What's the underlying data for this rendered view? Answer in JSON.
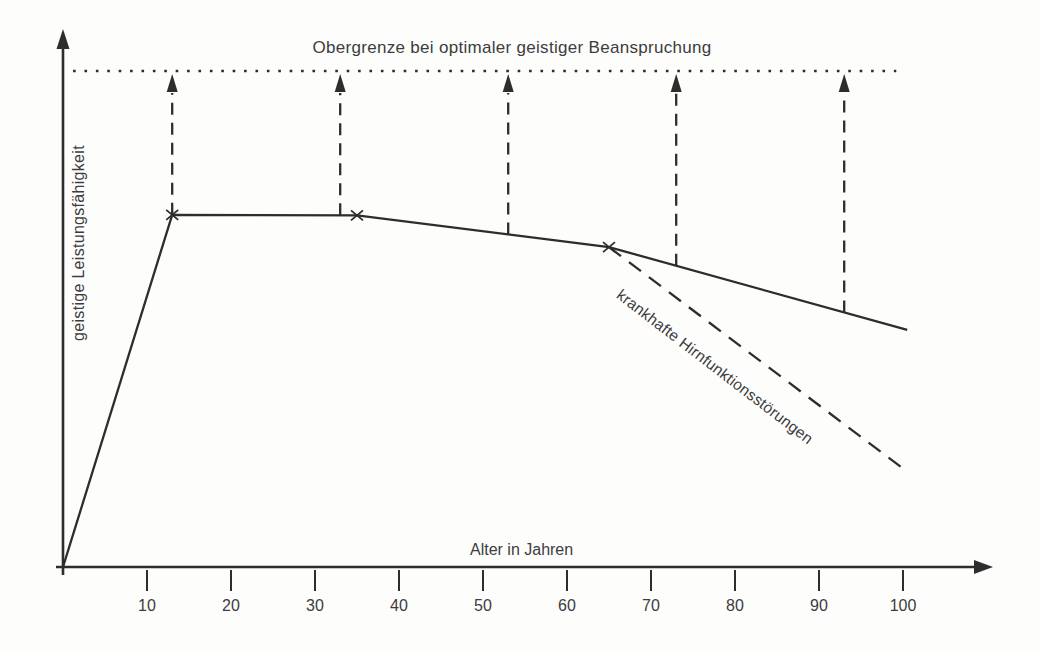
{
  "chart_data": {
    "type": "line",
    "title": "Obergrenze bei optimaler geistiger Beanspruchung",
    "xlabel": "Alter in Jahren",
    "ylabel": "geistige Leistungsfähigkeit",
    "x_ticks": [
      10,
      20,
      30,
      40,
      50,
      60,
      70,
      80,
      90,
      100
    ],
    "xlim": [
      0,
      110
    ],
    "ylim": [
      0,
      110
    ],
    "grid": false,
    "legend_position": "none",
    "series": [
      {
        "name": "geistige Leistungsfähigkeit",
        "style": "solid",
        "points": [
          [
            0,
            0
          ],
          [
            13,
            71
          ],
          [
            35,
            70.9
          ],
          [
            65,
            64.5
          ],
          [
            100.5,
            47.8
          ]
        ]
      },
      {
        "name": "krankhafte Hirnfunktionsstörungen",
        "style": "dashed",
        "points": [
          [
            65,
            64.5
          ],
          [
            100.2,
            19.6
          ]
        ]
      },
      {
        "name": "Obergrenze",
        "style": "dotted",
        "points": [
          [
            1.2,
            100
          ],
          [
            99.2,
            100
          ]
        ]
      }
    ],
    "x_markers_on_solid": [
      13,
      35,
      65
    ],
    "arrow_ages": [
      13,
      33,
      53,
      73,
      93
    ],
    "colors": {
      "line": "#2d2d2d",
      "text": "#3c3c3c",
      "background": "#fdfdfc"
    }
  }
}
